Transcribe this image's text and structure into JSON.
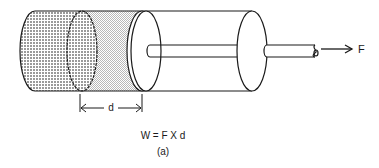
{
  "diagram": {
    "force_label": "F",
    "distance_label": "d",
    "equation": "W = F X d",
    "caption": "(a)",
    "colors": {
      "line": "#1a1a1a",
      "dotted_fill": "#cfcfcf",
      "shaded_fill": "#e2e2e2",
      "background": "#ffffff"
    }
  }
}
